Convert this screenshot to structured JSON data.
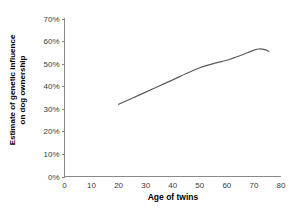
{
  "chart_data": {
    "type": "line",
    "title": "",
    "xlabel": "Age of twins",
    "ylabel": "Estimate of genetic influence on dog ownership",
    "ylabel_line1": "Estimate of genetic influence",
    "ylabel_line2": "on dog ownership",
    "xlim": [
      0,
      80
    ],
    "ylim": [
      0,
      70
    ],
    "grid": false,
    "legend": "none",
    "line_color": "#5a5a5a",
    "axis_color": "#8a8a8a",
    "x_ticks": [
      "0",
      "10",
      "20",
      "30",
      "40",
      "50",
      "60",
      "70",
      "80"
    ],
    "x_tick_values": [
      0,
      10,
      20,
      30,
      40,
      50,
      60,
      70,
      80
    ],
    "y_ticks": [
      "0%",
      "10%",
      "20%",
      "30%",
      "40%",
      "50%",
      "60%",
      "70%"
    ],
    "y_tick_values": [
      0,
      10,
      20,
      30,
      40,
      50,
      60,
      70
    ],
    "series": [
      {
        "name": "Estimate of genetic influence on dog ownership",
        "x": [
          20,
          25,
          30,
          35,
          40,
          45,
          50,
          55,
          60,
          65,
          70,
          72,
          74,
          75.5
        ],
        "values": [
          32.0,
          34.7,
          37.4,
          40.1,
          42.8,
          45.6,
          48.2,
          50.0,
          51.5,
          53.6,
          56.0,
          56.5,
          56.2,
          55.4
        ]
      }
    ]
  }
}
